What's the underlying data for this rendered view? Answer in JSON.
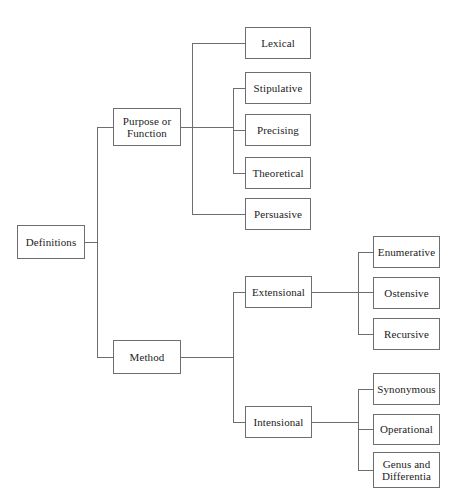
{
  "diagram": {
    "type": "tree",
    "orientation": "left-to-right",
    "style": {
      "box_border_color": "#6e6e6e",
      "box_fill_color": "#ffffff",
      "line_color": "#6e6e6e",
      "text_color": "#1c1c1c",
      "background_color": "#ffffff"
    },
    "nodes": [
      {
        "id": "definitions",
        "label": "Definitions",
        "level": 0,
        "x": 17,
        "y": 225,
        "w": 68,
        "h": 34,
        "font_size": 11
      },
      {
        "id": "purpose_or_function",
        "label": "Purpose or\nFunction",
        "level": 1,
        "x": 113,
        "y": 108,
        "w": 68,
        "h": 38,
        "font_size": 11
      },
      {
        "id": "method",
        "label": "Method",
        "level": 1,
        "x": 113,
        "y": 340,
        "w": 68,
        "h": 34,
        "font_size": 11
      },
      {
        "id": "lexical",
        "label": "Lexical",
        "level": 2,
        "x": 245,
        "y": 27,
        "w": 66,
        "h": 32,
        "font_size": 11
      },
      {
        "id": "stipulative",
        "label": "Stipulative",
        "level": 2,
        "x": 245,
        "y": 72,
        "w": 66,
        "h": 32,
        "font_size": 11
      },
      {
        "id": "precising",
        "label": "Precising",
        "level": 2,
        "x": 245,
        "y": 114,
        "w": 66,
        "h": 32,
        "font_size": 11
      },
      {
        "id": "theoretical",
        "label": "Theoretical",
        "level": 2,
        "x": 245,
        "y": 157,
        "w": 66,
        "h": 32,
        "font_size": 11
      },
      {
        "id": "persuasive",
        "label": "Persuasive",
        "level": 2,
        "x": 245,
        "y": 198,
        "w": 66,
        "h": 32,
        "font_size": 11
      },
      {
        "id": "extensional",
        "label": "Extensional",
        "level": 2,
        "x": 245,
        "y": 276,
        "w": 67,
        "h": 32,
        "font_size": 11
      },
      {
        "id": "intensional",
        "label": "Intensional",
        "level": 2,
        "x": 245,
        "y": 406,
        "w": 67,
        "h": 32,
        "font_size": 11
      },
      {
        "id": "enumerative",
        "label": "Enumerative",
        "level": 3,
        "x": 373,
        "y": 236,
        "w": 67,
        "h": 32,
        "font_size": 11
      },
      {
        "id": "ostensive",
        "label": "Ostensive",
        "level": 3,
        "x": 373,
        "y": 277,
        "w": 67,
        "h": 32,
        "font_size": 11
      },
      {
        "id": "recursive",
        "label": "Recursive",
        "level": 3,
        "x": 373,
        "y": 318,
        "w": 67,
        "h": 32,
        "font_size": 11
      },
      {
        "id": "synonymous",
        "label": "Synonymous",
        "level": 3,
        "x": 373,
        "y": 373,
        "w": 67,
        "h": 32,
        "font_size": 11
      },
      {
        "id": "operational",
        "label": "Operational",
        "level": 3,
        "x": 373,
        "y": 414,
        "w": 67,
        "h": 31,
        "font_size": 11
      },
      {
        "id": "genus_and_differentia",
        "label": "Genus and\nDifferentia",
        "level": 3,
        "x": 373,
        "y": 452,
        "w": 67,
        "h": 36,
        "font_size": 11
      }
    ],
    "edges": [
      {
        "from": "definitions",
        "to": "purpose_or_function"
      },
      {
        "from": "definitions",
        "to": "method"
      },
      {
        "from": "purpose_or_function",
        "to": "lexical"
      },
      {
        "from": "purpose_or_function",
        "to": "stipulative"
      },
      {
        "from": "purpose_or_function",
        "to": "precising"
      },
      {
        "from": "purpose_or_function",
        "to": "theoretical"
      },
      {
        "from": "purpose_or_function",
        "to": "persuasive"
      },
      {
        "from": "method",
        "to": "extensional"
      },
      {
        "from": "method",
        "to": "intensional"
      },
      {
        "from": "extensional",
        "to": "enumerative"
      },
      {
        "from": "extensional",
        "to": "ostensive"
      },
      {
        "from": "extensional",
        "to": "recursive"
      },
      {
        "from": "intensional",
        "to": "synonymous"
      },
      {
        "from": "intensional",
        "to": "operational"
      },
      {
        "from": "intensional",
        "to": "genus_and_differentia"
      }
    ],
    "connector_paths": [
      "M85,242 L97,242",
      "M97,127 L97,357",
      "M97,127 L113,127",
      "M97,357 L113,357",
      "M181,127 L233,127",
      "M192,43 L192,214",
      "M192,43 L245,43",
      "M192,214 L245,214",
      "M233,88 L233,173",
      "M233,88 L245,88",
      "M233,130 L245,130",
      "M233,173 L245,173",
      "M181,357 L233,357",
      "M233,292 L233,422",
      "M233,292 L245,292",
      "M233,422 L245,422",
      "M312,292 L358,292",
      "M358,252 L358,334",
      "M358,252 L373,252",
      "M358,292 L373,292",
      "M358,334 L373,334",
      "M312,422 L358,422",
      "M358,389 L358,470",
      "M358,389 L373,389",
      "M358,429 L373,429",
      "M358,470 L373,470"
    ]
  }
}
